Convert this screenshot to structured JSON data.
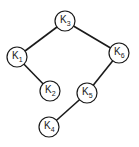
{
  "diagram": {
    "type": "binary-tree",
    "nodes": [
      {
        "id": "K3",
        "base": "K",
        "sub": "3",
        "cx": 65,
        "cy": 21
      },
      {
        "id": "K1",
        "base": "K",
        "sub": "1",
        "cx": 17,
        "cy": 57
      },
      {
        "id": "K6",
        "base": "K",
        "sub": "6",
        "cx": 119,
        "cy": 53
      },
      {
        "id": "K2",
        "base": "K",
        "sub": "2",
        "cx": 50,
        "cy": 91
      },
      {
        "id": "K5",
        "base": "K",
        "sub": "5",
        "cx": 87,
        "cy": 93
      },
      {
        "id": "K4",
        "base": "K",
        "sub": "4",
        "cx": 49,
        "cy": 127
      }
    ],
    "edges": [
      {
        "from": "K3",
        "to": "K1"
      },
      {
        "from": "K3",
        "to": "K6"
      },
      {
        "from": "K1",
        "to": "K2"
      },
      {
        "from": "K6",
        "to": "K5"
      },
      {
        "from": "K5",
        "to": "K4"
      }
    ]
  }
}
